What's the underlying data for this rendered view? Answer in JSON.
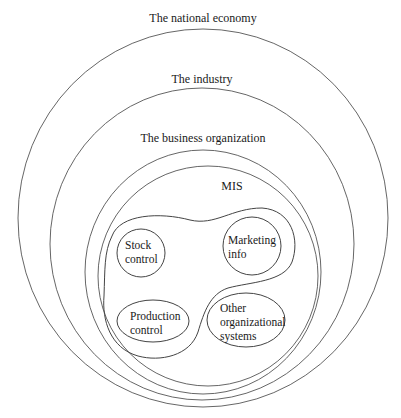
{
  "diagram": {
    "type": "nested-containment",
    "levels": [
      {
        "id": "national",
        "label": "The national economy"
      },
      {
        "id": "industry",
        "label": "The industry"
      },
      {
        "id": "business",
        "label": "The business organization"
      },
      {
        "id": "mis",
        "label": "MIS"
      }
    ],
    "subsystems": {
      "stock": {
        "line1": "Stock",
        "line2": "control"
      },
      "marketing": {
        "line1": "Marketing",
        "line2": "info"
      },
      "production": {
        "line1": "Production",
        "line2": "control"
      },
      "other": {
        "line1": "Other",
        "line2": "organizational",
        "line3": "systems"
      }
    },
    "colors": {
      "background": "#ffffff",
      "stroke": "#555555",
      "text": "#1a1a1a"
    }
  }
}
